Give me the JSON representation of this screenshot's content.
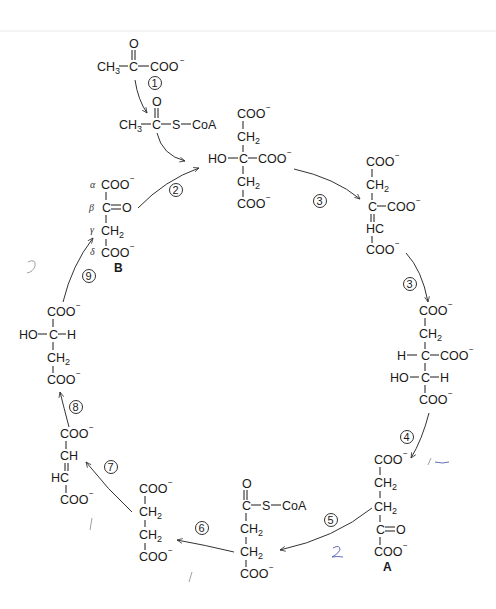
{
  "diagram": {
    "compounds": {
      "pyruvate": {
        "left": "CH3",
        "center": "C",
        "top": "O",
        "right": "COO⁻"
      },
      "acetyl_coa": {
        "left": "CH3",
        "center": "C",
        "top": "O",
        "right1": "S",
        "right2": "CoA"
      },
      "citrate": {
        "rows": [
          "COO⁻",
          "CH2",
          "HO—C—COO⁻",
          "CH2",
          "COO⁻"
        ]
      },
      "cis_aconitate": {
        "rows": [
          "COO⁻",
          "CH2",
          "C—COO⁻",
          "HC",
          "COO⁻"
        ]
      },
      "isocitrate": {
        "rows": [
          "COO⁻",
          "CH2",
          "H—C—COO⁻",
          "HO—C—H",
          "COO⁻"
        ]
      },
      "alpha_ketoglutarate": {
        "rows": [
          "COO⁻",
          "CH2",
          "CH2",
          "C=O",
          "COO⁻"
        ],
        "label": "A"
      },
      "succinyl_coa": {
        "rows": [
          "O",
          "C—S—CoA",
          "CH2",
          "CH2",
          "COO⁻"
        ]
      },
      "succinate": {
        "rows": [
          "COO⁻",
          "CH2",
          "CH2",
          "COO⁻"
        ]
      },
      "fumarate": {
        "rows": [
          "COO⁻",
          "CH",
          "HC",
          "COO⁻"
        ]
      },
      "malate": {
        "rows": [
          "COO⁻",
          "HO—C—H",
          "CH2",
          "COO⁻"
        ]
      },
      "oxaloacetate": {
        "rows": [
          "COO⁻",
          "C=O",
          "CH2",
          "COO⁻"
        ],
        "greek": [
          "α",
          "β",
          "γ",
          "δ"
        ],
        "label": "B"
      }
    },
    "step_numbers": [
      "1",
      "2",
      "3",
      "3",
      "4",
      "5",
      "6",
      "7",
      "8",
      "9"
    ],
    "handwritten_marks": [
      "?",
      "—",
      "2",
      "/",
      "/",
      "/"
    ]
  },
  "text": {
    "CH3": "CH",
    "sub3": "3",
    "sub2": "2",
    "C": "C",
    "O": "O",
    "COO": "COO",
    "minus": "−",
    "S": "S",
    "CoA": "CoA",
    "HO": "HO",
    "H": "H",
    "HC": "HC",
    "CH": "CH",
    "CH2": "CH",
    "alpha": "α",
    "beta": "β",
    "gamma": "γ",
    "delta": "δ",
    "labelA": "A",
    "labelB": "B",
    "n1": "1",
    "n2": "2",
    "n3": "3",
    "n4": "4",
    "n5": "5",
    "n6": "6",
    "n7": "7",
    "n8": "8",
    "n9": "9"
  }
}
